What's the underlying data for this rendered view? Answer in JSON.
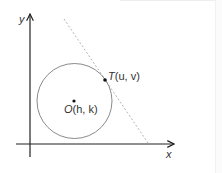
{
  "diagram": {
    "axes": {
      "x_label": "x",
      "y_label": "y"
    },
    "center": {
      "name": "O",
      "coords": "(h, k)"
    },
    "tangent_point": {
      "name": "T",
      "coords": "(u, v)"
    },
    "colors": {
      "axis": "#222222",
      "circle": "#8a8a8a",
      "tangent_line": "#b5b5b5",
      "points": "#111111",
      "text": "#333333"
    }
  }
}
